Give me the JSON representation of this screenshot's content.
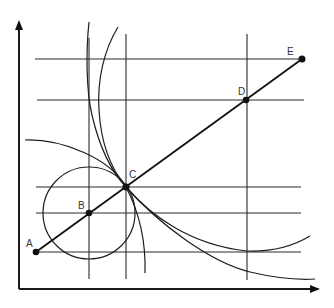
{
  "diagram": {
    "type": "geometric construction",
    "axes": {
      "x_axis": {
        "from": [
          19,
          289
        ],
        "to": [
          321,
          289
        ],
        "arrow": true
      },
      "y_axis": {
        "from": [
          19,
          289
        ],
        "to": [
          19,
          18
        ],
        "arrow": true
      }
    },
    "horizontal_lines_y": [
      59,
      100,
      187,
      213,
      252
    ],
    "vertical_lines_x": [
      89,
      126,
      247
    ],
    "points": [
      {
        "label": "A",
        "x": 36,
        "y": 252,
        "label_dx": -10,
        "label_dy": -6
      },
      {
        "label": "B",
        "x": 89,
        "y": 213,
        "label_dx": -11,
        "label_dy": -5
      },
      {
        "label": "C",
        "x": 126,
        "y": 187,
        "label_dx": 3,
        "label_dy": -8
      },
      {
        "label": "D",
        "x": 247,
        "y": 100,
        "label_dx": -8,
        "label_dy": -6
      },
      {
        "label": "E",
        "x": 302,
        "y": 59,
        "label_dx": -15,
        "label_dy": -5
      }
    ],
    "line_AE": {
      "from": "A",
      "to": "E"
    },
    "circle_small": {
      "cx": 89,
      "cy": 213,
      "r": 46
    },
    "curves": [
      "large circular arc through C",
      "upper-left curve through C to lower right",
      "upper-right curve through C with minimum near D-vertical",
      "small circle centered at B tangent at C"
    ]
  }
}
